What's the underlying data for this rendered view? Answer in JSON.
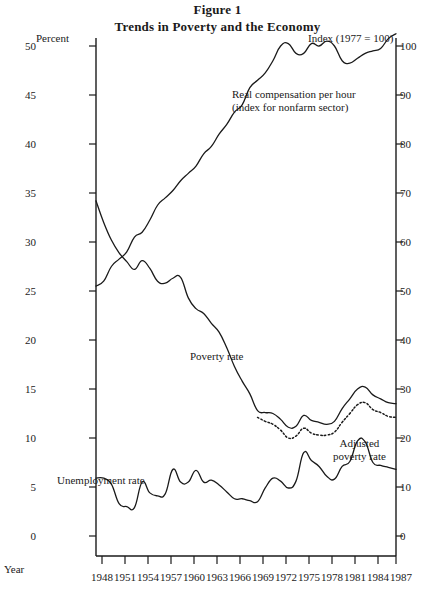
{
  "title": {
    "line1": "Figure 1",
    "line2": "Trends in Poverty and the Economy"
  },
  "axes": {
    "left_caption": "Percent",
    "right_caption": "Index (1977  =  100)",
    "x_caption": "Year",
    "left_ticks": [
      "50",
      "45",
      "40",
      "35",
      "30",
      "25",
      "20",
      "15",
      "10",
      "5",
      "0"
    ],
    "right_ticks": [
      "100",
      "90",
      "80",
      "70",
      "60",
      "50",
      "40",
      "30",
      "20",
      "10",
      "0"
    ],
    "x_ticks": [
      "1948",
      "1951",
      "1954",
      "1957",
      "1960",
      "1963",
      "1966",
      "1969",
      "1972",
      "1975",
      "1978",
      "1981",
      "1984",
      "1987"
    ]
  },
  "labels": {
    "compensation_line1": "Real compensation per hour",
    "compensation_line2": "(index for nonfarm sector)",
    "poverty": "Poverty rate",
    "adjusted_line1": "Adjusted",
    "adjusted_line2": "poverty rate",
    "unemployment": "Unemployment rate"
  },
  "colors": {
    "ink": "#1a1a1a",
    "background": "#ffffff"
  },
  "chart_data": {
    "type": "line",
    "title": "Trends in Poverty and the Economy",
    "subtitle": "Figure 1",
    "xlabel": "Year",
    "ylabel": "Percent",
    "y2label": "Index (1977 = 100)",
    "xlim": [
      1948,
      1987
    ],
    "ylim": [
      0,
      52
    ],
    "y2lim": [
      0,
      104
    ],
    "grid": false,
    "legend": "annotations",
    "x": [
      1948,
      1949,
      1950,
      1951,
      1952,
      1953,
      1954,
      1955,
      1956,
      1957,
      1958,
      1959,
      1960,
      1961,
      1962,
      1963,
      1964,
      1965,
      1966,
      1967,
      1968,
      1969,
      1970,
      1971,
      1972,
      1973,
      1974,
      1975,
      1976,
      1977,
      1978,
      1979,
      1980,
      1981,
      1982,
      1983,
      1984,
      1985,
      1986,
      1987
    ],
    "series": [
      {
        "name": "Poverty rate",
        "axis": "left",
        "style": "solid",
        "units": "percent",
        "values": [
          34.2,
          32.0,
          30.2,
          28.9,
          28.0,
          27.2,
          28.1,
          27.3,
          26.0,
          25.8,
          26.3,
          26.4,
          24.3,
          23.2,
          22.7,
          21.7,
          20.8,
          19.2,
          17.3,
          15.8,
          14.5,
          12.8,
          12.6,
          12.5,
          11.9,
          11.1,
          11.2,
          12.3,
          11.8,
          11.6,
          11.4,
          11.7,
          13.0,
          14.0,
          15.0,
          15.2,
          14.4,
          14.0,
          13.6,
          13.5
        ]
      },
      {
        "name": "Adjusted poverty rate",
        "axis": "left",
        "style": "dotted",
        "units": "percent",
        "values": [
          null,
          null,
          null,
          null,
          null,
          null,
          null,
          null,
          null,
          null,
          null,
          null,
          null,
          null,
          null,
          null,
          null,
          null,
          null,
          null,
          null,
          12.1,
          11.7,
          11.4,
          10.8,
          10.0,
          10.2,
          11.0,
          10.5,
          10.3,
          10.3,
          10.6,
          11.6,
          12.5,
          13.4,
          13.6,
          12.9,
          12.6,
          12.2,
          12.1
        ]
      },
      {
        "name": "Real compensation per hour (index for nonfarm sector)",
        "axis": "right",
        "style": "solid",
        "units": "index",
        "values": [
          51.0,
          52.0,
          55.0,
          56.5,
          58.0,
          61.0,
          62.0,
          64.5,
          67.5,
          69.0,
          70.5,
          72.5,
          74.0,
          75.5,
          78.0,
          79.5,
          82.0,
          84.0,
          86.5,
          88.0,
          91.5,
          93.0,
          94.5,
          97.0,
          100.0,
          100.5,
          98.5,
          98.5,
          100.5,
          100.0,
          101.0,
          100.0,
          97.0,
          96.5,
          97.5,
          98.5,
          99.0,
          99.5,
          101.5,
          102.5
        ]
      },
      {
        "name": "Unemployment rate",
        "axis": "left",
        "style": "solid",
        "units": "percent",
        "values": [
          5.9,
          5.9,
          5.3,
          3.3,
          3.0,
          2.9,
          5.5,
          4.4,
          4.1,
          4.3,
          6.8,
          5.5,
          5.5,
          6.7,
          5.5,
          5.7,
          5.2,
          4.5,
          3.8,
          3.8,
          3.6,
          3.5,
          4.9,
          5.9,
          5.6,
          4.9,
          5.6,
          8.5,
          7.7,
          7.1,
          6.1,
          5.8,
          7.1,
          7.6,
          9.7,
          9.6,
          7.5,
          7.2,
          7.0,
          6.8
        ]
      }
    ],
    "annotations": [
      {
        "text": "Real compensation per hour (index for nonfarm sector)",
        "near_x": 1973,
        "near_y_index": 93
      },
      {
        "text": "Poverty rate",
        "near_x": 1966,
        "near_y": 19
      },
      {
        "text": "Adjusted poverty rate",
        "near_x": 1981,
        "near_y": 11
      },
      {
        "text": "Unemployment rate",
        "near_x": 1955,
        "near_y": 8
      }
    ]
  }
}
